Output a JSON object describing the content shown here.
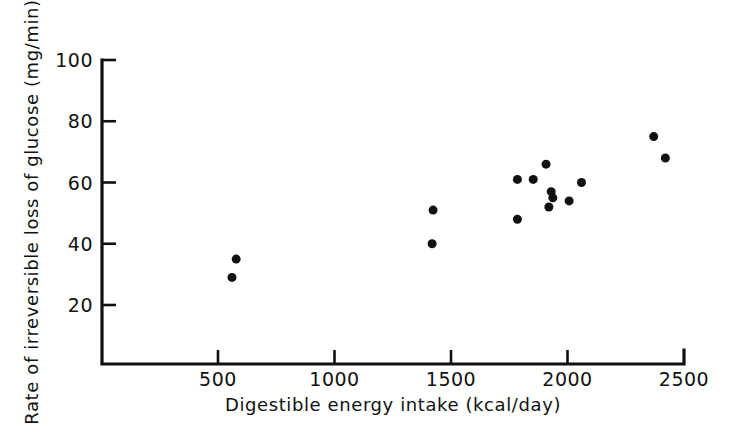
{
  "chart_data": {
    "type": "scatter",
    "title": "",
    "xlabel": "Digestible energy intake (kcal/day)",
    "ylabel": "Rate of irreversible loss of glucose (mg/min)",
    "xlim": [
      0,
      2500
    ],
    "ylim": [
      0,
      100
    ],
    "xticks": [
      500,
      1000,
      1500,
      2000,
      2500
    ],
    "xtick_labels": [
      "500",
      "1000",
      "1500",
      "2000",
      "2500"
    ],
    "yticks": [
      20,
      40,
      60,
      80,
      100
    ],
    "ytick_labels": [
      "20",
      "40",
      "60",
      "80",
      "100"
    ],
    "grid": false,
    "legend": null,
    "marker": "filled-circle",
    "marker_color": "#111111",
    "marker_size_px": 9,
    "series": [
      {
        "name": "observations",
        "points": [
          {
            "x": 560,
            "y": 29
          },
          {
            "x": 578,
            "y": 35
          },
          {
            "x": 1419,
            "y": 40
          },
          {
            "x": 1423,
            "y": 51
          },
          {
            "x": 1785,
            "y": 48
          },
          {
            "x": 1785,
            "y": 61
          },
          {
            "x": 1853,
            "y": 61
          },
          {
            "x": 1908,
            "y": 66
          },
          {
            "x": 1920,
            "y": 52
          },
          {
            "x": 1930,
            "y": 57
          },
          {
            "x": 1937,
            "y": 55
          },
          {
            "x": 2007,
            "y": 54
          },
          {
            "x": 2060,
            "y": 60
          },
          {
            "x": 2370,
            "y": 75
          },
          {
            "x": 2420,
            "y": 68
          }
        ]
      }
    ]
  },
  "figure": {
    "background_color": "#ffffff",
    "axis_color": "#111111"
  }
}
